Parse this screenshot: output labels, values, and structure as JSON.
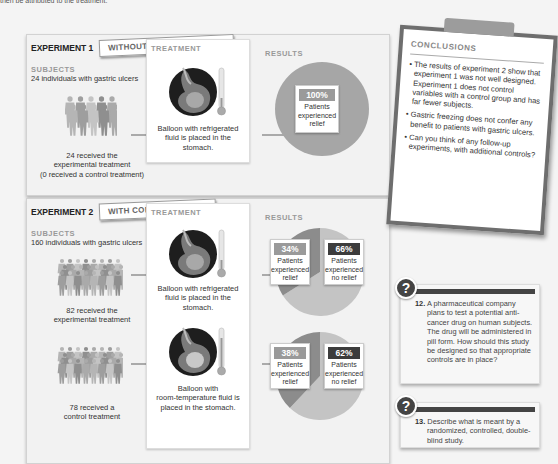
{
  "intro_fragment": "then be attributed to the treatment.",
  "experiment1": {
    "title": "EXPERIMENT 1",
    "tag": "WITHOUT CONTROL GROUP",
    "subjects": {
      "heading": "SUBJECTS",
      "description": "24 individuals with gastric ulcers",
      "groups": [
        {
          "caption_lines": [
            "24 received the",
            "experimental treatment",
            "(0 received a control treatment)"
          ]
        }
      ]
    },
    "treatment": {
      "heading": "TREATMENT",
      "items": [
        {
          "icon": "stomach-balloon-cold-icon",
          "caption_lines": [
            "Balloon with refrigerated",
            "fluid is placed in the",
            "stomach."
          ]
        }
      ]
    },
    "results": {
      "heading": "RESULTS",
      "items": [
        {
          "percent_label": "100%",
          "value": 100,
          "text_lines": [
            "Patients",
            "experienced",
            "relief"
          ]
        }
      ]
    }
  },
  "experiment2": {
    "title": "EXPERIMENT 2",
    "tag": "WITH CONTROL GROUP",
    "subjects": {
      "heading": "SUBJECTS",
      "description": "160 individuals with gastric ulcers",
      "groups": [
        {
          "caption_lines": [
            "82 received the",
            "experimental treatment"
          ]
        },
        {
          "caption_lines": [
            "78 received a",
            "control treatment"
          ]
        }
      ]
    },
    "treatment": {
      "heading": "TREATMENT",
      "items": [
        {
          "icon": "stomach-balloon-cold-icon",
          "caption_lines": [
            "Balloon with refrigerated",
            "fluid is placed in the",
            "stomach."
          ]
        },
        {
          "icon": "stomach-balloon-room-temp-icon",
          "caption_lines": [
            "Balloon with",
            "room-temperature fluid is",
            "placed in the stomach."
          ]
        }
      ]
    },
    "results": {
      "heading": "RESULTS",
      "pies": [
        {
          "relief": {
            "percent_label": "34%",
            "value": 34,
            "text_lines": [
              "Patients",
              "experienced",
              "relief"
            ]
          },
          "no_relief": {
            "percent_label": "66%",
            "value": 66,
            "text_lines": [
              "Patients",
              "experienced",
              "no relief"
            ]
          }
        },
        {
          "relief": {
            "percent_label": "38%",
            "value": 38,
            "text_lines": [
              "Patients",
              "experienced",
              "relief"
            ]
          },
          "no_relief": {
            "percent_label": "62%",
            "value": 62,
            "text_lines": [
              "Patients",
              "experienced",
              "no relief"
            ]
          }
        }
      ]
    }
  },
  "conclusions": {
    "heading": "CONCLUSIONS",
    "bullets": [
      "The results of experiment 2 show that experiment 1 was not well designed. Experiment 1 does not control variables with a control group and has far fewer subjects.",
      "Gastric freezing does not confer any benefit to patients with gastric ulcers.",
      "Can you think of any follow-up experiments, with additional controls?"
    ]
  },
  "questions": [
    {
      "number": "12.",
      "icon": "question-mark-icon",
      "text": "A pharmaceutical company plans to test a potential anti-cancer drug on human subjects. The drug will be administered in pill form. How should this study be designed so that appropriate controls are in place?"
    },
    {
      "number": "13.",
      "icon": "question-mark-icon",
      "text": "Describe what is meant by a randomized, controlled, double-blind study."
    }
  ],
  "colors": {
    "relief": "#9a9a9a",
    "no_relief": "#3c3c3c",
    "pie_relief": "#8c8c8c",
    "pie_no_relief": "#c4c4c4",
    "pie_full": "#a6a6a6"
  }
}
